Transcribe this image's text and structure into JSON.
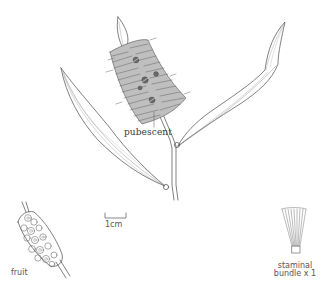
{
  "figure": {
    "labels": {
      "pubescent": "pubescent",
      "scale_bar": "1cm",
      "fruit": "fruit",
      "staminal_line1": "staminal",
      "staminal_line2": "bundle x 1"
    },
    "colors": {
      "background": "#ffffff",
      "ink": "#3a3a3a",
      "light_ink": "#8a8a8a"
    }
  }
}
